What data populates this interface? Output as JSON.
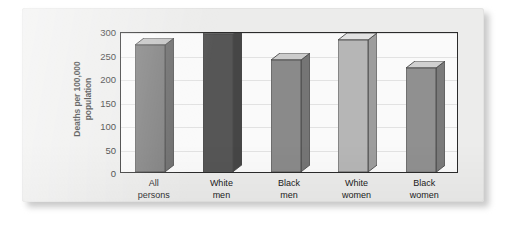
{
  "chart_data": {
    "type": "bar",
    "title": "",
    "subtitle": "",
    "xlabel": "",
    "ylabel": "Deaths per 100,000\npopulation",
    "categories": [
      "All\npersons",
      "White\nmen",
      "Black\nmen",
      "White\nwomen",
      "Black\nwomen"
    ],
    "category_labels_flat": [
      "All persons",
      "White men",
      "Black men",
      "White women",
      "Black women"
    ],
    "values": [
      270,
      293,
      238,
      281,
      222
    ],
    "ylim": [
      0,
      300
    ],
    "ytick_values": [
      0,
      50,
      100,
      150,
      200,
      250,
      300
    ],
    "ytick_labels": [
      "0",
      "50",
      "100",
      "150",
      "200",
      "250",
      "300"
    ],
    "grid": true,
    "legend": "none",
    "bar_colors": [
      "#7d7d7d",
      "#565656",
      "#8a8a8a",
      "#b6b6b6",
      "#909090"
    ],
    "bar_top_colors": [
      "#c2c2c2",
      "#9d9d9d",
      "#cccccc",
      "#e2e2e2",
      "#d0d0d0"
    ],
    "bar_side_colors": [
      "#6a6a6a",
      "#464646",
      "#757575",
      "#9d9d9d",
      "#7a7a7a"
    ],
    "style": "3d-extruded-bars",
    "plot_background": "#fafafa",
    "frame_color": "#2b2b2b",
    "card_background": "#ececeb"
  },
  "figure": {
    "ylabel_line1": "Deaths per 100,000",
    "ylabel_line2": "population"
  }
}
